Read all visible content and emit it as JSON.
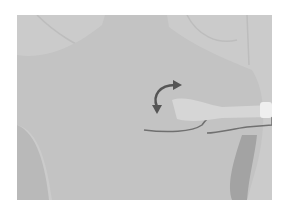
{
  "image": {
    "description": "Grayscale photograph of a person's upper back with a handheld probe on the left scapula region and a curved double-headed rotation arrow",
    "colors": {
      "background": "#ffffff",
      "skin": "#c4c4c4",
      "backdrop": "#cdcdcd",
      "shadow": "#a4a4a4",
      "probe": "#d8d8d8",
      "probe_tip": "#eeeeee",
      "arrow": "#555555"
    }
  }
}
